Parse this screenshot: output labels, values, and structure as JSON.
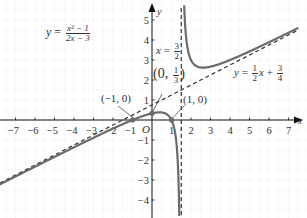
{
  "chart_data": {
    "type": "line",
    "title": "",
    "function": "y = (x^2 - 1)/(2x - 3)",
    "xlabel": "x",
    "ylabel": "y",
    "xlim": [
      -7.8,
      7.6
    ],
    "ylim": [
      -4.9,
      5.6
    ],
    "origin_label": "O",
    "x_ticks": [
      -7,
      -6,
      -5,
      -4,
      -3,
      -2,
      -1,
      1,
      2,
      3,
      4,
      5,
      6,
      7
    ],
    "y_ticks": [
      -4,
      -3,
      -2,
      -1,
      1,
      2,
      3,
      4,
      5
    ],
    "grid": true,
    "series": [
      {
        "name": "y = (x^2-1)/(2x-3)",
        "style": "solid",
        "color": "#666666",
        "points_left_branch": [
          [
            -7.6,
            -3.12
          ],
          [
            -7,
            -2.82
          ],
          [
            -6,
            -2.33
          ],
          [
            -5,
            -1.85
          ],
          [
            -4,
            -1.36
          ],
          [
            -3,
            -0.89
          ],
          [
            -2,
            -0.43
          ],
          [
            -1,
            0
          ],
          [
            0,
            0.33
          ],
          [
            0.5,
            0.375
          ],
          [
            1,
            0
          ],
          [
            1.2,
            -0.73
          ],
          [
            1.3,
            -1.73
          ],
          [
            1.4,
            -4.8
          ]
        ],
        "points_right_branch": [
          [
            1.6,
            7.8
          ],
          [
            1.8,
            7.47
          ],
          [
            2,
            3
          ],
          [
            2.618,
            2.618
          ],
          [
            3,
            2.67
          ],
          [
            4,
            3
          ],
          [
            5,
            3.43
          ],
          [
            6,
            3.89
          ],
          [
            7,
            4.36
          ],
          [
            7.5,
            4.6
          ]
        ]
      },
      {
        "name": "asymptote x = 3/2",
        "style": "dashed",
        "color": "#333333",
        "x": 1.5
      },
      {
        "name": "asymptote y = 1/2 x + 3/4",
        "style": "dashed",
        "color": "#333333",
        "slope": 0.5,
        "intercept": 0.75
      }
    ],
    "annotations": [
      {
        "text": "(-1, 0)",
        "x": -1,
        "y": 0
      },
      {
        "text": "(0, 1/3)",
        "x": 0,
        "y": 0.3333
      },
      {
        "text": "(1, 0)",
        "x": 1,
        "y": 0
      },
      {
        "text": "x = 3/2"
      },
      {
        "text": "y = 1/2 x + 3/4"
      },
      {
        "text": "y = (x^2 - 1)/(2x - 3)"
      }
    ]
  },
  "labels": {
    "eq_y": "y",
    "eq_equals": " = ",
    "eq_num": "x² − 1",
    "eq_den": "2x − 3",
    "asym_v_x": "x",
    "asym_v_eq": " = ",
    "asym_v_num": "3",
    "asym_v_den": "2",
    "asym_o_y": "y",
    "asym_o_eq": " = ",
    "asym_o_num1": "1",
    "asym_o_den1": "2",
    "asym_o_x": "x",
    "asym_o_plus": " + ",
    "asym_o_num2": "3",
    "asym_o_den2": "4",
    "pt_neg1": "(−1, 0)",
    "pt_0_open": "(0, ",
    "pt_0_num": "1",
    "pt_0_den": "3",
    "pt_0_close": ")",
    "pt_1": "(1, 0)",
    "origin": "O",
    "axis_x": "x",
    "axis_y": "y"
  },
  "colors": {
    "curve": "#6a6a6a",
    "axis": "#111111",
    "dash": "#333333",
    "grid": "#f2f2f2",
    "point": "#6a6a6a"
  }
}
